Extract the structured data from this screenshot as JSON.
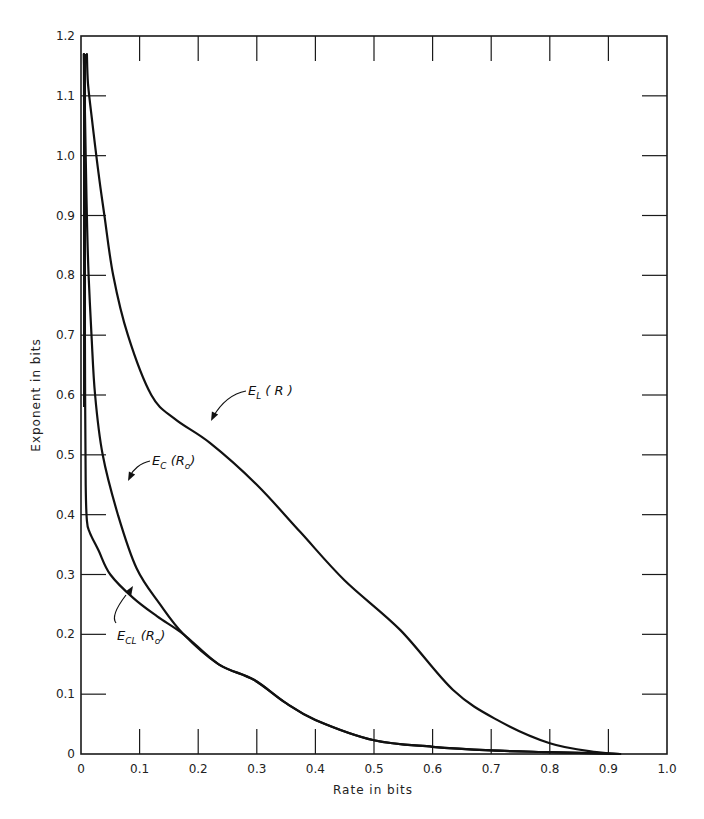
{
  "chart_data": {
    "type": "line",
    "title": "",
    "xlabel": "Rate in bits",
    "ylabel": "Exponent in bits",
    "xlim": [
      0,
      1.0
    ],
    "ylim": [
      0,
      1.2
    ],
    "grid": false,
    "legend": "none (curves labeled inline with arrows)",
    "x_ticks": [
      "0",
      "0.1",
      "0.2",
      "0.3",
      "0.4",
      "0.5",
      "0.6",
      "0.7",
      "0.8",
      "0.9",
      "1.0"
    ],
    "y_ticks": [
      "0",
      "0.1",
      "0.2",
      "0.3",
      "0.4",
      "0.5",
      "0.6",
      "0.7",
      "0.8",
      "0.9",
      "1.0",
      "1.1",
      "1.2"
    ],
    "series": [
      {
        "name": "E_L(R)",
        "label_main": "E",
        "label_sub": "L",
        "label_rest": "( R )",
        "points": [
          [
            0.01,
            1.17
          ],
          [
            0.012,
            1.12
          ],
          [
            0.02,
            1.05
          ],
          [
            0.03,
            0.97
          ],
          [
            0.04,
            0.9
          ],
          [
            0.055,
            0.8
          ],
          [
            0.08,
            0.7
          ],
          [
            0.12,
            0.6
          ],
          [
            0.16,
            0.56
          ],
          [
            0.22,
            0.52
          ],
          [
            0.3,
            0.45
          ],
          [
            0.375,
            0.37
          ],
          [
            0.45,
            0.29
          ],
          [
            0.545,
            0.207
          ],
          [
            0.635,
            0.107
          ],
          [
            0.71,
            0.057
          ],
          [
            0.8,
            0.018
          ],
          [
            0.88,
            0.003
          ],
          [
            0.92,
            0.0
          ]
        ]
      },
      {
        "name": "E_C(R_0)",
        "label_main": "E",
        "label_sub": "C",
        "label_rest": "(R",
        "label_sub2": "o",
        "label_end": ")",
        "points": [
          [
            0.005,
            1.17
          ],
          [
            0.008,
            1.0
          ],
          [
            0.01,
            0.9
          ],
          [
            0.013,
            0.8
          ],
          [
            0.018,
            0.7
          ],
          [
            0.024,
            0.6
          ],
          [
            0.037,
            0.5
          ],
          [
            0.063,
            0.4
          ],
          [
            0.095,
            0.31
          ],
          [
            0.135,
            0.25
          ],
          [
            0.175,
            0.2
          ],
          [
            0.235,
            0.15
          ],
          [
            0.295,
            0.124
          ],
          [
            0.35,
            0.085
          ],
          [
            0.4,
            0.057
          ],
          [
            0.5,
            0.023
          ],
          [
            0.6,
            0.012
          ],
          [
            0.7,
            0.006
          ],
          [
            0.8,
            0.003
          ],
          [
            0.92,
            0.0
          ]
        ]
      },
      {
        "name": "E_CL(R_0)",
        "label_main": "E",
        "label_sub": "CL",
        "label_rest": "(R",
        "label_sub2": "o",
        "label_end": ")",
        "points": [
          [
            0.005,
            1.17
          ],
          [
            0.006,
            0.9
          ],
          [
            0.007,
            0.6
          ],
          [
            0.008,
            0.45
          ],
          [
            0.01,
            0.39
          ],
          [
            0.015,
            0.37
          ],
          [
            0.03,
            0.34
          ],
          [
            0.05,
            0.3
          ],
          [
            0.09,
            0.26
          ],
          [
            0.13,
            0.23
          ],
          [
            0.175,
            0.2
          ],
          [
            0.235,
            0.15
          ],
          [
            0.295,
            0.124
          ],
          [
            0.35,
            0.085
          ],
          [
            0.4,
            0.057
          ],
          [
            0.5,
            0.023
          ],
          [
            0.6,
            0.012
          ],
          [
            0.7,
            0.006
          ],
          [
            0.8,
            0.003
          ],
          [
            0.92,
            0.0
          ]
        ]
      }
    ],
    "annotations": [
      {
        "text": "E_L(R)",
        "arrow_to": [
          0.22,
          0.56
        ]
      },
      {
        "text": "E_C(R_0)",
        "arrow_to": [
          0.085,
          0.34
        ]
      },
      {
        "text": "E_CL(R_0)",
        "arrow_to": [
          0.085,
          0.25
        ]
      }
    ]
  }
}
